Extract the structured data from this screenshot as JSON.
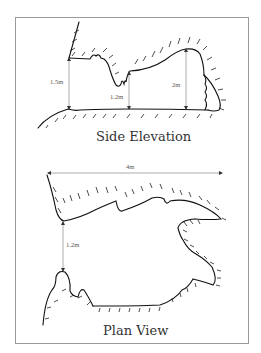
{
  "side_elevation": {
    "title": "Side Elevation",
    "dimensions": {
      "left_height": "1.5m",
      "middle_height": "1.2m",
      "right_height": "2m"
    }
  },
  "plan_view": {
    "title": "Plan View",
    "dimensions": {
      "width": "4m",
      "entrance_width": "1.2m"
    }
  },
  "colors": {
    "line": "#111111",
    "dimension_line": "#888888",
    "frame": "#9a9a9a"
  }
}
